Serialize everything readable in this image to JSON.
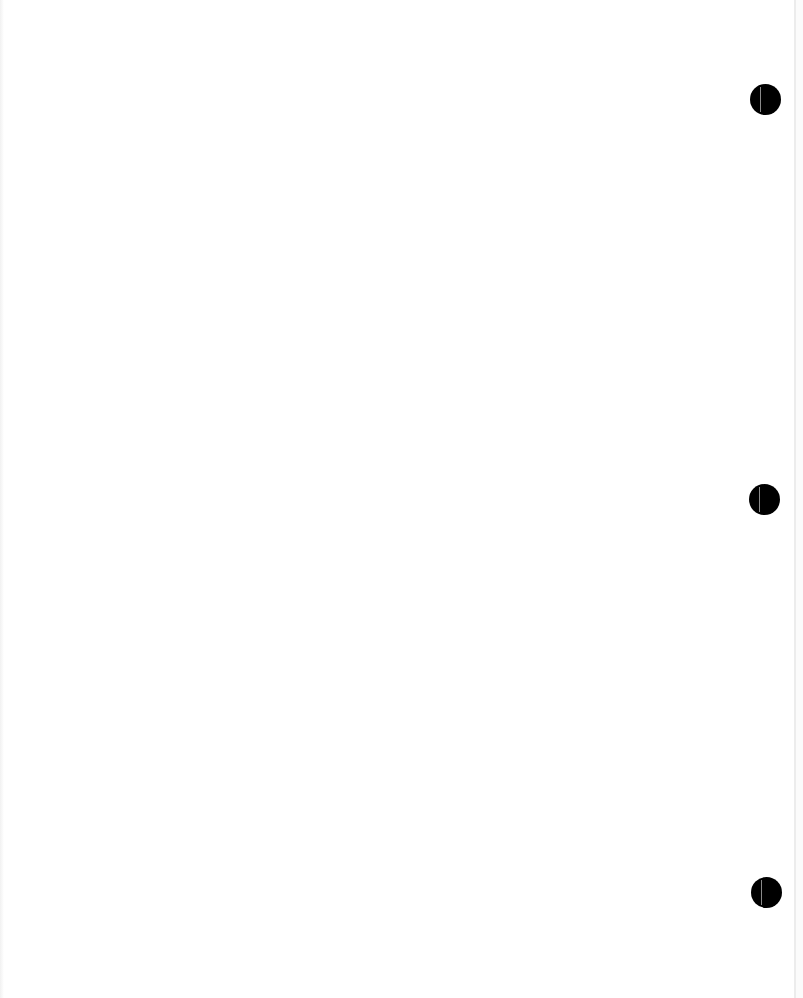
{
  "document": {
    "type": "blank scanned page",
    "text": "",
    "background_color": "#ffffff"
  },
  "punch_holes": [
    {
      "position": "top",
      "cx": 765,
      "cy": 99,
      "diameter": 31,
      "color": "#000000"
    },
    {
      "position": "middle",
      "cx": 764,
      "cy": 499,
      "diameter": 31,
      "color": "#000000"
    },
    {
      "position": "bottom",
      "cx": 766,
      "cy": 892,
      "diameter": 31,
      "color": "#000000"
    }
  ]
}
